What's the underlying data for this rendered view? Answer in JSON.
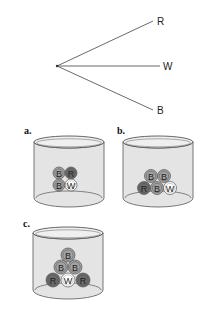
{
  "tree": {
    "origin": [
      57,
      66
    ],
    "branches": [
      {
        "label": "R",
        "end": [
          153,
          21
        ],
        "label_pos": [
          157,
          25
        ]
      },
      {
        "label": "W",
        "end": [
          160,
          66
        ],
        "label_pos": [
          163,
          70
        ]
      },
      {
        "label": "B",
        "end": [
          153,
          110
        ],
        "label_pos": [
          157,
          114
        ]
      }
    ]
  },
  "colors": {
    "B": "#a3a3a3",
    "R": "#6b6b6b",
    "W": "#ffffff",
    "cylinder_fill": "#e4e4e4",
    "stroke": "#555555"
  },
  "panels": [
    {
      "label": "a.",
      "label_pos": [
        24,
        134
      ],
      "cylinder": {
        "x": 34,
        "w": 70,
        "top": 142,
        "bottom": 198,
        "ry": 6
      },
      "ball_r": 6,
      "balls": [
        {
          "c": "B",
          "x": 59,
          "y": 173
        },
        {
          "c": "R",
          "x": 71,
          "y": 173
        },
        {
          "c": "B",
          "x": 59,
          "y": 185
        },
        {
          "c": "W",
          "x": 71,
          "y": 185
        }
      ]
    },
    {
      "label": "b.",
      "label_pos": [
        117,
        134
      ],
      "cylinder": {
        "x": 123,
        "w": 70,
        "top": 142,
        "bottom": 198,
        "ry": 6
      },
      "ball_r": 6.5,
      "balls": [
        {
          "c": "B",
          "x": 151,
          "y": 176
        },
        {
          "c": "B",
          "x": 164,
          "y": 176
        },
        {
          "c": "R",
          "x": 144,
          "y": 188
        },
        {
          "c": "B",
          "x": 157,
          "y": 188
        },
        {
          "c": "W",
          "x": 170,
          "y": 188
        }
      ]
    },
    {
      "label": "c.",
      "label_pos": [
        23,
        227
      ],
      "cylinder": {
        "x": 33,
        "w": 70,
        "top": 233,
        "bottom": 290,
        "ry": 6
      },
      "ball_r": 7,
      "balls": [
        {
          "c": "B",
          "x": 68,
          "y": 255
        },
        {
          "c": "B",
          "x": 61,
          "y": 267
        },
        {
          "c": "B",
          "x": 75,
          "y": 267
        },
        {
          "c": "R",
          "x": 53,
          "y": 280
        },
        {
          "c": "W",
          "x": 68,
          "y": 280
        },
        {
          "c": "R",
          "x": 83,
          "y": 280
        }
      ]
    }
  ]
}
